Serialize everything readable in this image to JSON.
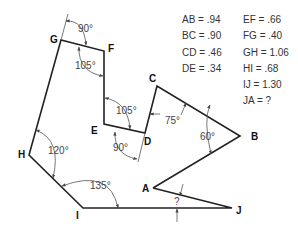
{
  "vertices": {
    "A": "A",
    "B": "B",
    "C": "C",
    "D": "D",
    "E": "E",
    "F": "F",
    "G": "G",
    "H": "H",
    "I": "I",
    "J": "J"
  },
  "angles": {
    "G_ext": "90°",
    "F": "105°",
    "E": "105°",
    "D_ext": "90°",
    "D_C": "75°",
    "B": "60°",
    "H": "120°",
    "I": "135°",
    "J": "?"
  },
  "lengths": {
    "col1": [
      {
        "label": "AB = .94"
      },
      {
        "label": "BC = .90"
      },
      {
        "label": "CD = .46"
      },
      {
        "label": "DE = .34"
      }
    ],
    "col2": [
      {
        "label": "EF = .66"
      },
      {
        "label": "FG = .40"
      },
      {
        "label": "GH = 1.06"
      },
      {
        "label": "HI = .68"
      },
      {
        "label": "IJ = 1.30"
      },
      {
        "label": "JA = ?"
      }
    ]
  }
}
